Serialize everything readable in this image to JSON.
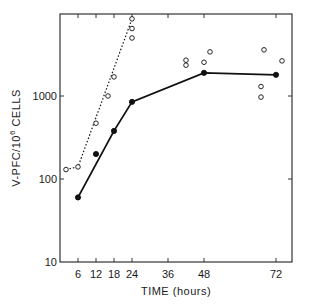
{
  "chart_data": {
    "type": "line",
    "title": "",
    "xlabel": "TIME (hours)",
    "ylabel": "V-PFC/10^6 CELLS",
    "ylabel_parts": {
      "main": "V-PFC/10",
      "sup": "6",
      "tail": " CELLS"
    },
    "yscale": "log",
    "xlim": [
      0,
      77
    ],
    "ylim": [
      10,
      10000
    ],
    "x_ticks": [
      6,
      12,
      18,
      24,
      36,
      48,
      72
    ],
    "x_tick_labels": [
      "6",
      "12",
      "18",
      "24",
      "36",
      "48",
      "72"
    ],
    "y_ticks": [
      10,
      100,
      1000
    ],
    "y_tick_labels": [
      "10",
      "100",
      "1000"
    ],
    "grid": false,
    "legend": null,
    "series": [
      {
        "name": "open circles (dotted line)",
        "marker": "open-circle",
        "line": "dotted",
        "points": [
          {
            "x": 2,
            "y": 130
          },
          {
            "x": 6,
            "y": 140
          },
          {
            "x": 12,
            "y": 470
          },
          {
            "x": 16,
            "y": 1000
          },
          {
            "x": 18,
            "y": 1700
          },
          {
            "x": 24,
            "y": 5000
          },
          {
            "x": 24,
            "y": 6500
          },
          {
            "x": 24,
            "y": 8500
          }
        ],
        "line_points": [
          {
            "x": 2,
            "y": 130
          },
          {
            "x": 6,
            "y": 140
          },
          {
            "x": 24,
            "y": 8500
          }
        ]
      },
      {
        "name": "filled circles (solid line)",
        "marker": "filled-circle",
        "line": "solid",
        "points": [
          {
            "x": 6,
            "y": 60
          },
          {
            "x": 12,
            "y": 200
          },
          {
            "x": 18,
            "y": 380
          },
          {
            "x": 24,
            "y": 850
          },
          {
            "x": 48,
            "y": 1900
          },
          {
            "x": 72,
            "y": 1800
          }
        ],
        "line_points": [
          {
            "x": 6,
            "y": 60
          },
          {
            "x": 18,
            "y": 380
          },
          {
            "x": 24,
            "y": 850
          },
          {
            "x": 48,
            "y": 1900
          },
          {
            "x": 72,
            "y": 1800
          }
        ]
      },
      {
        "name": "open circles (scatter, late)",
        "marker": "open-circle",
        "line": "none",
        "points": [
          {
            "x": 42,
            "y": 2700
          },
          {
            "x": 42,
            "y": 2350
          },
          {
            "x": 48,
            "y": 2550
          },
          {
            "x": 50,
            "y": 3400
          },
          {
            "x": 68,
            "y": 3600
          },
          {
            "x": 74,
            "y": 2650
          },
          {
            "x": 67,
            "y": 1300
          },
          {
            "x": 67,
            "y": 970
          }
        ]
      }
    ]
  }
}
